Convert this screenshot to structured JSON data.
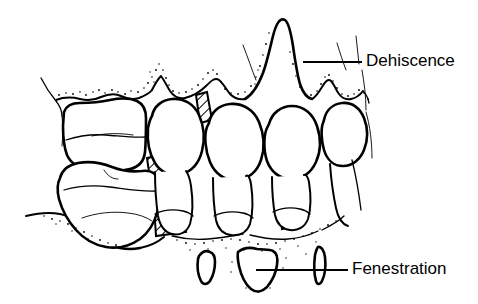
{
  "figure": {
    "kind": "line-drawing-diagram",
    "background_color": "#ffffff",
    "ink_color": "#000000",
    "width": 478,
    "height": 304
  },
  "labels": [
    {
      "id": "dehiscence",
      "text": "Dehiscence",
      "text_x": 366,
      "text_y": 62,
      "leader": {
        "x1": 303,
        "y1": 62,
        "x2": 362,
        "y2": 62
      }
    },
    {
      "id": "fenestration",
      "text": "Fenestration",
      "text_x": 352,
      "text_y": 270,
      "leader": {
        "x1": 256,
        "y1": 270,
        "x2": 348,
        "y2": 270
      }
    }
  ],
  "anatomy": {
    "teeth": [
      {
        "name": "molar-upper-left",
        "position": "far-left-upper"
      },
      {
        "name": "molar-lower-left",
        "position": "far-left-lower"
      },
      {
        "name": "premolar-1",
        "position": "left-center"
      },
      {
        "name": "canine",
        "position": "center"
      },
      {
        "name": "premolar-2",
        "position": "right-center"
      },
      {
        "name": "incisor-right",
        "position": "far-right"
      }
    ],
    "bone_crest": "stippled scalloped alveolar crest line",
    "interdental_septa": "diagonal hatched bone columns between roots",
    "dehiscence_defect": "tall V-shaped bone recession exposing root surface",
    "fenestration_fragments": [
      {
        "name": "fenestration-window-left"
      },
      {
        "name": "fenestration-window-center"
      },
      {
        "name": "fenestration-window-right-sliver"
      }
    ]
  }
}
